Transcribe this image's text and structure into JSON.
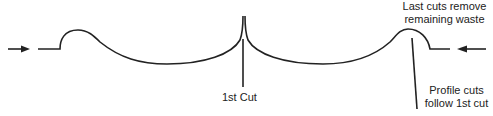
{
  "diagram": {
    "labels": {
      "first_cut": "1st Cut",
      "last_cuts_line1": "Last cuts remove",
      "last_cuts_line2": "remaining waste",
      "profile_line1": "Profile cuts",
      "profile_line2": "follow 1st cut"
    },
    "colors": {
      "stroke": "#222222",
      "background": "#ffffff"
    },
    "icons": [
      "arrow-right-icon",
      "arrow-left-icon"
    ]
  }
}
